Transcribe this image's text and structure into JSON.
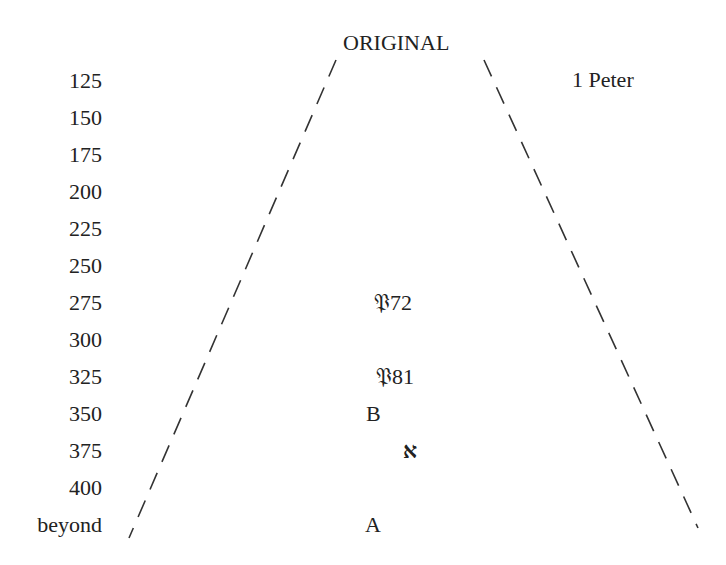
{
  "diagram": {
    "title": "ORIGINAL",
    "book": "1 Peter",
    "date_axis": [
      "125",
      "150",
      "175",
      "200",
      "225",
      "250",
      "275",
      "300",
      "325",
      "350",
      "375",
      "400",
      "beyond"
    ],
    "manuscripts": [
      {
        "label": "𝔓72",
        "date": "275"
      },
      {
        "label": "𝔓81",
        "date": "325"
      },
      {
        "label": "B",
        "date": "350"
      },
      {
        "label": "א",
        "date": "375"
      },
      {
        "label": "A",
        "date": "beyond"
      }
    ],
    "line_style": "dashed",
    "line_color": "#333333"
  }
}
